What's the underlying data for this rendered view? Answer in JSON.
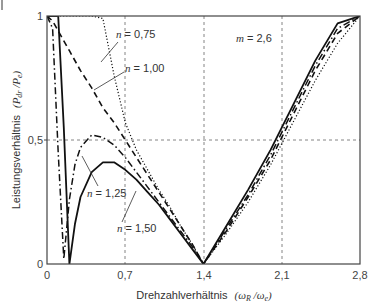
{
  "chart_data": {
    "type": "line",
    "title": "",
    "xlabel": "Drehzahlverhältnis (ωR /ωe)",
    "ylabel": "Leistungsverhältnis (Pdr /Pe)",
    "xlim": [
      0,
      2.8
    ],
    "ylim": [
      0,
      1
    ],
    "xticks": [
      "0",
      "0,7",
      "1,4",
      "2,1",
      "2,8"
    ],
    "yticks": [
      "0",
      "0,5",
      "1"
    ],
    "grid": "dashed at x=0.7, 1.4, 2.1 and y=0.5",
    "annotation_param": "m = 2,6",
    "series": [
      {
        "name": "n = 0,75",
        "style": "dotted",
        "x": [
          0.0,
          0.1,
          0.2,
          0.3,
          0.4,
          0.5,
          0.6,
          0.7,
          0.8,
          0.9,
          1.0,
          1.1,
          1.2,
          1.3,
          1.4,
          1.6,
          1.8,
          2.0,
          2.2,
          2.4,
          2.6,
          2.8
        ],
        "y": [
          1.0,
          1.0,
          1.0,
          1.0,
          1.0,
          0.99,
          0.76,
          0.57,
          0.46,
          0.38,
          0.3,
          0.23,
          0.15,
          0.08,
          0.0,
          0.12,
          0.25,
          0.4,
          0.57,
          0.74,
          0.89,
          1.0
        ]
      },
      {
        "name": "n = 1,00",
        "style": "dashed",
        "x": [
          0.0,
          0.05,
          0.1,
          0.2,
          0.3,
          0.4,
          0.5,
          0.6,
          0.7,
          0.8,
          0.9,
          1.0,
          1.1,
          1.2,
          1.3,
          1.4,
          1.6,
          1.8,
          2.0,
          2.2,
          2.4,
          2.6,
          2.8
        ],
        "y": [
          1.0,
          0.98,
          0.94,
          0.86,
          0.78,
          0.71,
          0.63,
          0.57,
          0.5,
          0.43,
          0.36,
          0.29,
          0.22,
          0.15,
          0.08,
          0.0,
          0.13,
          0.27,
          0.42,
          0.6,
          0.78,
          0.93,
          1.0
        ]
      },
      {
        "name": "n = 1,25",
        "style": "dashdot",
        "x": [
          0.0,
          0.05,
          0.1,
          0.15,
          0.2,
          0.25,
          0.3,
          0.4,
          0.5,
          0.6,
          0.7,
          0.8,
          0.9,
          1.0,
          1.1,
          1.2,
          1.3,
          1.4,
          1.6,
          1.8,
          2.0,
          2.2,
          2.4,
          2.6,
          2.8
        ],
        "y": [
          1.0,
          0.95,
          0.45,
          0.02,
          0.26,
          0.4,
          0.47,
          0.52,
          0.51,
          0.48,
          0.43,
          0.37,
          0.31,
          0.25,
          0.19,
          0.13,
          0.07,
          0.0,
          0.14,
          0.28,
          0.44,
          0.62,
          0.8,
          0.95,
          1.0
        ]
      },
      {
        "name": "n = 1,50",
        "style": "solid",
        "x": [
          0.0,
          0.1,
          0.15,
          0.2,
          0.25,
          0.3,
          0.4,
          0.5,
          0.6,
          0.7,
          0.8,
          0.9,
          1.0,
          1.1,
          1.2,
          1.3,
          1.4,
          1.6,
          1.8,
          2.0,
          2.2,
          2.4,
          2.6,
          2.8
        ],
        "y": [
          1.0,
          1.0,
          0.55,
          0.0,
          0.16,
          0.27,
          0.37,
          0.41,
          0.41,
          0.38,
          0.34,
          0.29,
          0.24,
          0.18,
          0.12,
          0.06,
          0.0,
          0.15,
          0.3,
          0.46,
          0.64,
          0.82,
          0.97,
          1.0
        ]
      }
    ]
  },
  "axes": {
    "x_title_main": "Drehzahlverhältnis",
    "x_title_sym": "(ωR /ωe)",
    "y_title_main": "Leistungsverhältnis",
    "y_title_sym": "(Pdr /Pe)",
    "xticks": [
      "0",
      "0,7",
      "1,4",
      "2,1",
      "2,8"
    ],
    "yticks": [
      "0",
      "0,5",
      "1"
    ]
  },
  "annotations": {
    "m": "m = 2,6",
    "n075": "n = 0,75",
    "n100": "n = 1,00",
    "n125": "n = 1,25",
    "n150": "n = 1,50"
  }
}
